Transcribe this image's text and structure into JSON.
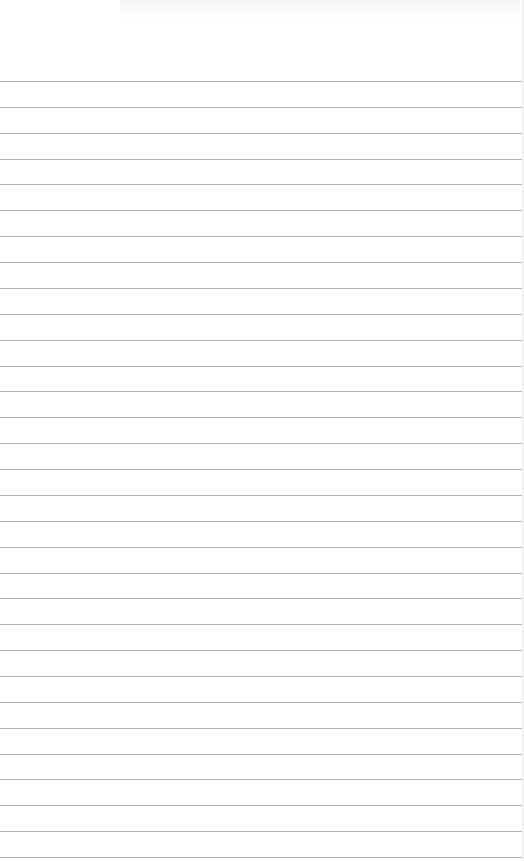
{
  "page": {
    "type": "ruled-paper",
    "background": "#ffffff",
    "line_color": "#b4b4b4",
    "first_line_y": 81,
    "line_spacing": 25.87,
    "line_count": 31
  }
}
